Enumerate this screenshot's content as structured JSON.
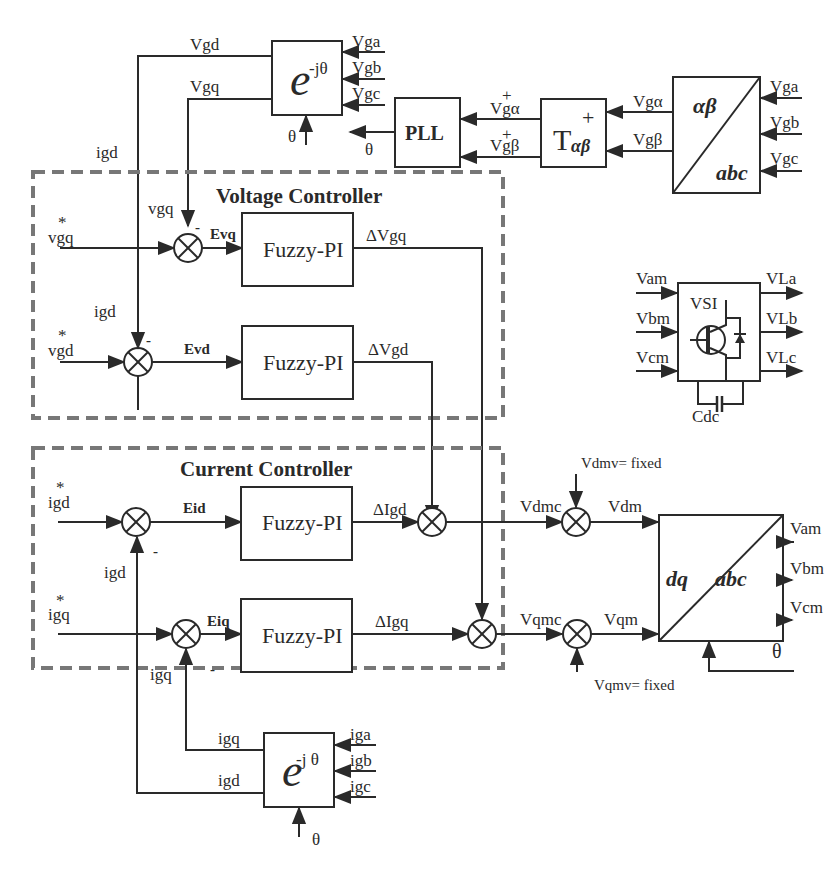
{
  "park_voltage": {
    "block": "e",
    "exponent": "-jθ",
    "in_a": "Vga",
    "in_b": "Vgb",
    "in_c": "Vgc",
    "out_d": "Vgd",
    "out_q": "Vgq",
    "theta": "θ"
  },
  "pll": {
    "label": "PLL",
    "in_alpha": "V",
    "in_alpha_sub": "gα",
    "in_beta": "V",
    "in_beta_sub": "gβ",
    "plus": "+",
    "out_theta": "θ"
  },
  "t_block": {
    "label": "T",
    "sub": "αβ",
    "sup": "+",
    "in_alpha": "Vgα",
    "in_beta": "Vgβ"
  },
  "clarke": {
    "top": "αβ",
    "bottom": "abc",
    "in_a": "Vga",
    "in_b": "Vgb",
    "in_c": "Vgc"
  },
  "voltage_controller": {
    "title": "Voltage Controller",
    "ref_q": "vgq",
    "ref_d": "vgd",
    "star": "*",
    "fb_q": "vgq",
    "fb_d": "igd",
    "minus": "-",
    "err_q": "Evq",
    "err_d": "Evd",
    "block": "Fuzzy-PI",
    "out_q": "ΔVgq",
    "out_d": "ΔVgd"
  },
  "vsi": {
    "label": "VSI",
    "in_a": "Vam",
    "in_b": "Vbm",
    "in_c": "Vcm",
    "out_a": "VLa",
    "out_b": "VLb",
    "out_c": "VLc",
    "cap": "Cdc"
  },
  "current_controller": {
    "title": "Current Controller",
    "ref_d": "igd",
    "ref_q": "igq",
    "star": "*",
    "fb_d": "igd",
    "fb_q": "igq",
    "minus": "-",
    "err_d": "Eid",
    "err_q": "Eiq",
    "block": "Fuzzy-PI",
    "out_d": "ΔIgd",
    "out_q": "ΔIgq"
  },
  "modulation": {
    "vdmc": "Vdmc",
    "vqmc": "Vqmc",
    "vdmv": "Vdmv= fixed",
    "vqmv": "Vqmv= fixed",
    "vdm": "Vdm",
    "vqm": "Vqm"
  },
  "inv_park": {
    "left": "dq",
    "right": "abc",
    "out_a": "Vam",
    "out_b": "Vbm",
    "out_c": "Vcm",
    "theta": "θ"
  },
  "park_current": {
    "block": "e",
    "exponent": "-j θ",
    "in_a": "iga",
    "in_b": "igb",
    "in_c": "igc",
    "out_q": "igq",
    "out_d": "igd",
    "theta": "θ"
  }
}
